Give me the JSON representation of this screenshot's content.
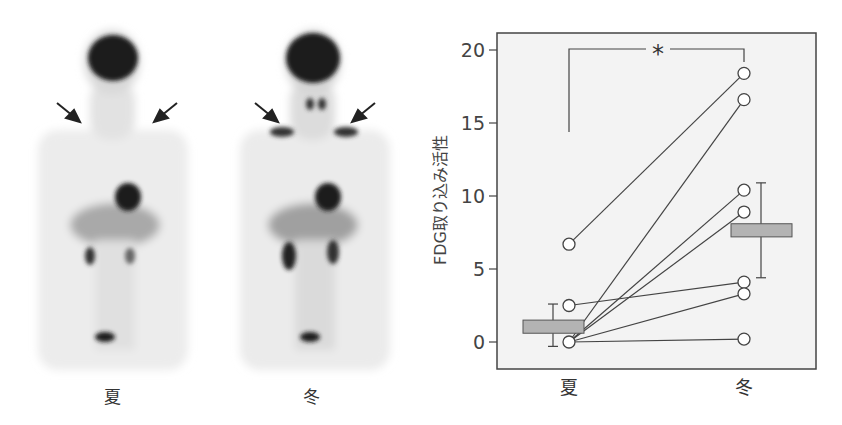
{
  "figure": {
    "pet_images": [
      {
        "label": "夏",
        "season": "summer",
        "arrows": 2
      },
      {
        "label": "冬",
        "season": "winter",
        "arrows": 2
      }
    ]
  },
  "chart_data": {
    "type": "scatter",
    "title": "",
    "xlabel": "",
    "ylabel": "FDG取り込み活性",
    "categories": [
      "夏",
      "冬"
    ],
    "ylim": [
      -1.8,
      21.5
    ],
    "yticks": [
      0,
      5,
      10,
      15,
      20
    ],
    "grid": false,
    "paired_series": [
      {
        "name": "subject-1",
        "values": [
          6.7,
          18.4
        ]
      },
      {
        "name": "subject-2",
        "values": [
          0.0,
          16.6
        ]
      },
      {
        "name": "subject-3",
        "values": [
          0.0,
          10.4
        ]
      },
      {
        "name": "subject-4",
        "values": [
          0.0,
          8.9
        ]
      },
      {
        "name": "subject-5",
        "values": [
          2.5,
          4.1
        ]
      },
      {
        "name": "subject-6",
        "values": [
          0.0,
          3.3
        ]
      },
      {
        "name": "subject-7",
        "values": [
          0.0,
          0.2
        ]
      }
    ],
    "summary_bars": [
      {
        "category": "夏",
        "mean_low": 0.6,
        "mean_high": 1.5,
        "whisker_low": -0.3,
        "whisker_high": 2.6
      },
      {
        "category": "冬",
        "mean_low": 7.2,
        "mean_high": 8.1,
        "whisker_low": 4.4,
        "whisker_high": 10.9
      }
    ],
    "annotations": [
      {
        "type": "significance-bracket",
        "text": "*",
        "between": [
          "夏",
          "冬"
        ]
      }
    ],
    "colors": {
      "box_fill": "#b3b3b3",
      "line": "#444444",
      "plot_bg": "#f3f3f3",
      "marker_fill": "#ffffff"
    }
  }
}
